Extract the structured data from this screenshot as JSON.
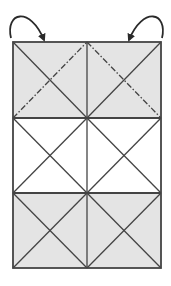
{
  "diagram": {
    "type": "fold-diagram",
    "canvas": {
      "width": 171,
      "height": 286,
      "background": "#ffffff"
    },
    "colors": {
      "shaded_fill": "#e4e4e4",
      "unshaded_fill": "#ffffff",
      "line": "#444444",
      "arrow": "#2a2a2a"
    },
    "grid": {
      "left": 13,
      "right": 161,
      "top": 42,
      "bottom": 268,
      "column_divider_x": 87,
      "row_dividers_y": [
        118,
        193
      ],
      "columns": 2,
      "rows": 3
    },
    "rows": [
      {
        "name": "top-row",
        "shaded": true,
        "cells": [
          {
            "name": "top-left-cell",
            "solid_diagonal": "tl-br",
            "dashdot_diagonal": "bl-tr"
          },
          {
            "name": "top-right-cell",
            "solid_diagonal": "bl-tr",
            "dashdot_diagonal": "tl-br"
          }
        ]
      },
      {
        "name": "middle-row",
        "shaded": false,
        "cells": [
          {
            "name": "middle-left-cell",
            "solid_diagonals": [
              "tl-br",
              "bl-tr"
            ]
          },
          {
            "name": "middle-right-cell",
            "solid_diagonals": [
              "tl-br",
              "bl-tr"
            ]
          }
        ]
      },
      {
        "name": "bottom-row",
        "shaded": true,
        "cells": [
          {
            "name": "bottom-left-cell",
            "solid_diagonals": [
              "tl-br",
              "bl-tr"
            ]
          },
          {
            "name": "bottom-right-cell",
            "solid_diagonals": [
              "tl-br",
              "bl-tr"
            ]
          }
        ]
      }
    ],
    "arrows": [
      {
        "name": "left-fold-arrow",
        "direction": "curving clockwise from left edge into top-left corner area",
        "from": [
          10,
          37
        ],
        "control": [
          5,
          2
        ],
        "to": [
          45,
          42
        ]
      },
      {
        "name": "right-fold-arrow",
        "direction": "curving counter-clockwise from right edge into top-right corner area",
        "from": [
          163,
          37
        ],
        "control": [
          168,
          2
        ],
        "to": [
          129,
          42
        ]
      }
    ],
    "line_styles": {
      "solid": "solid",
      "valley_fold": "dash-dot"
    }
  }
}
